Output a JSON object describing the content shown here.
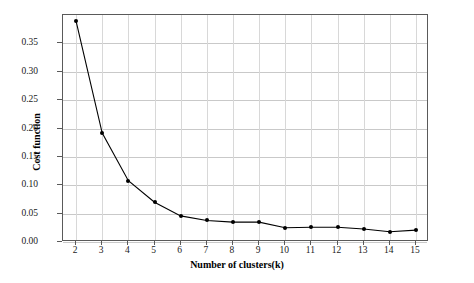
{
  "chart_data": {
    "type": "line",
    "title": "",
    "xlabel": "Number of clusters(k)",
    "ylabel": "Cost function",
    "x": [
      2,
      3,
      4,
      5,
      6,
      7,
      8,
      9,
      10,
      11,
      12,
      13,
      14,
      15
    ],
    "values": [
      0.389,
      0.192,
      0.108,
      0.07,
      0.046,
      0.038,
      0.035,
      0.035,
      0.025,
      0.026,
      0.026,
      0.023,
      0.018,
      0.021
    ],
    "series": [
      {
        "name": "Cost function",
        "values": [
          0.389,
          0.192,
          0.108,
          0.07,
          0.046,
          0.038,
          0.035,
          0.035,
          0.025,
          0.026,
          0.026,
          0.023,
          0.018,
          0.021
        ]
      }
    ],
    "xticklabels": [
      "2",
      "3",
      "4",
      "5",
      "6",
      "7",
      "8",
      "9",
      "10",
      "11",
      "12",
      "13",
      "14",
      "15"
    ],
    "yticklabels": [
      "0.00",
      "0.05",
      "0.10",
      "0.15",
      "0.20",
      "0.25",
      "0.30",
      "0.35"
    ],
    "ytickvalues": [
      0.0,
      0.05,
      0.1,
      0.15,
      0.2,
      0.25,
      0.3,
      0.35
    ],
    "xlim": [
      1.5,
      15.5
    ],
    "ylim": [
      0.0,
      0.4
    ],
    "grid": true,
    "grid_axis": "both",
    "legend": "none",
    "line_color": "#000000",
    "marker_color": "#000000",
    "grid_color": "#c9c9c9",
    "axes_color": "#5a5a5a",
    "background": "#ffffff"
  }
}
